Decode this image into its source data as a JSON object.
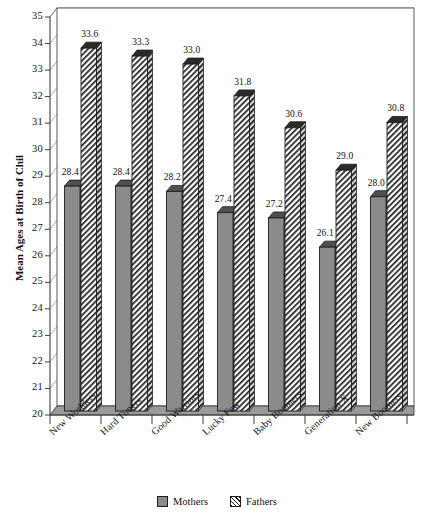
{
  "chart_data": {
    "type": "bar",
    "title": "",
    "xlabel": "",
    "ylabel": "Mean Ages at Birth of Chil",
    "ylim": [
      20,
      35
    ],
    "ystep": 1,
    "grid": true,
    "legend_position": "bottom",
    "categories": [
      "New Worlders",
      "Hard Timers",
      "Good Warriors",
      "Lucky Few",
      "Baby Boomers",
      "Generation X",
      "New Boomers"
    ],
    "yticks": [
      "35",
      "34",
      "33",
      "32",
      "31",
      "30",
      "29",
      "28",
      "27",
      "26",
      "25",
      "24",
      "23",
      "22",
      "21",
      "20"
    ],
    "series": [
      {
        "name": "Mothers",
        "swatch": "solid-gray",
        "color": "#8b8b8b",
        "values": [
          28.4,
          28.4,
          28.2,
          27.4,
          27.2,
          26.1,
          28.0
        ],
        "labels": [
          "28.4",
          "28.4",
          "28.2",
          "27.4",
          "27.2",
          "26.1",
          "28.0"
        ]
      },
      {
        "name": "Fathers",
        "swatch": "diagonal-hatch",
        "color": "#ffffff",
        "values": [
          33.6,
          33.3,
          33.0,
          31.8,
          30.6,
          29.0,
          30.8
        ],
        "labels": [
          "33.6",
          "33.3",
          "33.0",
          "31.8",
          "30.6",
          "29.0",
          "30.8"
        ]
      }
    ]
  },
  "legend": {
    "items": [
      {
        "label": "Mothers"
      },
      {
        "label": "Fathers"
      }
    ]
  },
  "colors": {
    "mothers_fill": "#8b8b8b",
    "fathers_fill": "#ffffff",
    "hatch": "#1c1c1c",
    "axis": "#4a4a4a",
    "grid": "#8d8d8d",
    "floor": "#9a9a9a",
    "background": "#ffffff"
  }
}
